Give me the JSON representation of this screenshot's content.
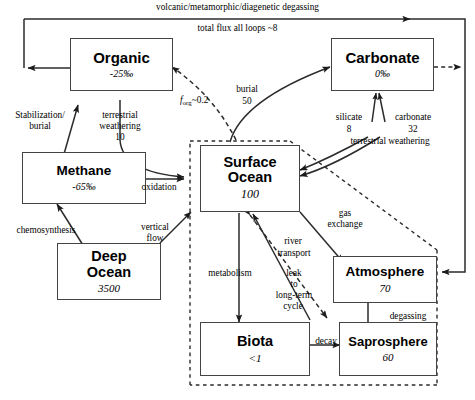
{
  "diagram": {
    "boxes": [
      {
        "id": "organic",
        "name": "Organic",
        "value": "-25‰"
      },
      {
        "id": "carbonate",
        "name": "Carbonate",
        "value": "0‰"
      },
      {
        "id": "methane",
        "name": "Methane",
        "value": "-65‰"
      },
      {
        "id": "deep_ocean",
        "name": "Deep\nOcean",
        "name_line1": "Deep",
        "name_line2": "Ocean",
        "value": "3500"
      },
      {
        "id": "surface_ocean",
        "name": "Surface Ocean",
        "name_line1": "Surface",
        "name_line2": "Ocean",
        "value": "100"
      },
      {
        "id": "atmosphere",
        "name": "Atmosphere",
        "value": "70"
      },
      {
        "id": "biota",
        "name": "Biota",
        "value": "<1"
      },
      {
        "id": "saprosphere",
        "name": "Saprosphere",
        "value": "60"
      }
    ],
    "labels": {
      "degassing_loop_line1": "volcanic/metamorphic/diagenetic degassing",
      "degassing_loop_line2": "total flux all loops ~8",
      "stabilization_line1": "Stabilization/",
      "stabilization_line2": "burial",
      "terrestrial_weathering_left_line1": "terrestrial",
      "terrestrial_weathering_left_line2": "weathering",
      "terrestrial_weathering_left_value": "10",
      "f_org_symbol": "f",
      "f_org_sub": "org",
      "f_org_value": "~0.2",
      "burial_line1": "burial",
      "burial_value": "50",
      "silicate": "silicate",
      "silicate_value": "8",
      "carbonate_flux": "carbonate",
      "carbonate_flux_value": "32",
      "terrestrial_weathering_right": "terrestrial weathering",
      "oxidation": "oxidation",
      "chemosynthesis": "chemosynthesis",
      "vertical_flow_line1": "vertical",
      "vertical_flow_line2": "flow",
      "gas_exchange_line1": "gas",
      "gas_exchange_line2": "exchange",
      "river_transport_line1": "river",
      "river_transport_line2": "transport",
      "metabolism": "metabolism",
      "leak_line1": "leak",
      "leak_line2": "to",
      "leak_line3": "long-term",
      "leak_line4": "cycle",
      "decay": "decay",
      "degassing": "degassing"
    },
    "colors": {
      "stroke": "#2b2b2b",
      "box_border": "#444444",
      "background": "#ffffff",
      "text": "#000000"
    }
  }
}
